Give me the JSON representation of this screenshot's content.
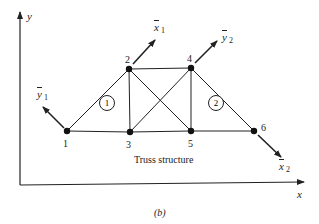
{
  "figure": {
    "label": "(b)",
    "caption": "Truss structure",
    "colors": {
      "ink": "#222222",
      "background": "#ffffff"
    }
  },
  "axes": {
    "x_label": "x",
    "y_label": "y"
  },
  "nodes": [
    {
      "id": "1",
      "x": 67,
      "y": 131
    },
    {
      "id": "2",
      "x": 129,
      "y": 69
    },
    {
      "id": "3",
      "x": 130,
      "y": 132
    },
    {
      "id": "4",
      "x": 191,
      "y": 68
    },
    {
      "id": "5",
      "x": 191,
      "y": 131
    },
    {
      "id": "6",
      "x": 254,
      "y": 131
    }
  ],
  "members": [
    [
      "1",
      "2"
    ],
    [
      "1",
      "3"
    ],
    [
      "2",
      "3"
    ],
    [
      "2",
      "4"
    ],
    [
      "2",
      "5"
    ],
    [
      "3",
      "4"
    ],
    [
      "3",
      "5"
    ],
    [
      "4",
      "5"
    ],
    [
      "4",
      "6"
    ],
    [
      "5",
      "6"
    ]
  ],
  "elements": [
    {
      "id": "1",
      "label": "1"
    },
    {
      "id": "2",
      "label": "2"
    }
  ],
  "local_axes": [
    {
      "name": "x̄",
      "sub": "1",
      "at_node": "2",
      "direction": "up-right"
    },
    {
      "name": "ȳ",
      "sub": "1",
      "at_node": "1",
      "direction": "up-left"
    },
    {
      "name": "ȳ",
      "sub": "2",
      "at_node": "4",
      "direction": "up-right"
    },
    {
      "name": "x̄",
      "sub": "2",
      "at_node": "6",
      "direction": "down-right"
    }
  ]
}
